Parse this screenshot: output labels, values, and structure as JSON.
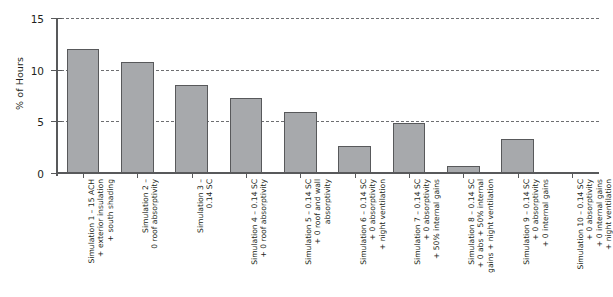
{
  "chart_data": {
    "type": "bar",
    "title": "",
    "xlabel": "",
    "ylabel": "% of Hours",
    "ylim": [
      0,
      15
    ],
    "yticks": [
      0,
      5,
      10,
      15
    ],
    "ytick_labels": [
      "0",
      "5",
      "10",
      "15"
    ],
    "grid": "horizontal-dashed",
    "legend": "none",
    "categories": [
      "Simulation 1 – 15 ACH\n+ exterior insulation\n+ south shading",
      "Simulation 2 –\n0 roof absorptivity",
      "Simulation 3 –\n0.14 SC",
      "Simulation 4 – 0.14 SC\n+ 0 roof absorptivity",
      "Simulation 5 – 0.14 SC\n+ 0 roof and wall\nabsorptivity",
      "Simulation 6 – 0.14 SC\n+ 0 absorptivity\n+ night ventilation",
      "Simulation 7 – 0.14 SC\n+ 0 absorptivity\n+ 50% internal gains",
      "Simulation 8 – 0.14 SC\n+ 0 abs + 50% internal\ngains + night ventilation",
      "Simulation 9 – 0.14 SC\n+ 0 absorptivity\n+ 0 internal gains",
      "Simulation 10 – 0.14 SC\n+ 0 absorptivity\n+ 0 internal gains\n+ night ventilation"
    ],
    "values": [
      12.0,
      10.7,
      8.5,
      7.3,
      5.9,
      2.6,
      4.8,
      0.65,
      3.3,
      0.0
    ],
    "colors": {
      "bar_fill": "#a7a9ac",
      "bar_stroke": "#58595b",
      "axis": "#58595b",
      "gridline": "#6d6e71",
      "text": "#231f20",
      "background": "#ffffff"
    }
  }
}
